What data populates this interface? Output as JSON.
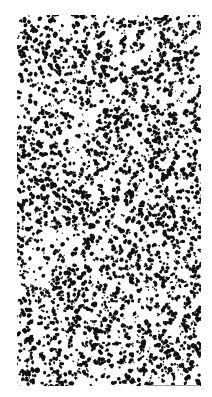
{
  "image": {
    "description": "Black speckle / stipple noise texture on white background",
    "background_color": "#ffffff",
    "speckle_color": "#111111",
    "edge_color": "#9a9a9a",
    "region": {
      "x": 17,
      "y": 15,
      "width": 184,
      "height": 371
    },
    "speckle": {
      "seed": 1337,
      "cluster_count": 2600,
      "min_radius": 0.6,
      "max_radius": 2.2
    }
  }
}
